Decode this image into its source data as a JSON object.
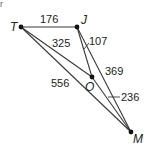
{
  "diagram": {
    "corner_mark": "r",
    "vertices": {
      "T": {
        "label": "T",
        "x": 21,
        "y": 27
      },
      "J": {
        "label": "J",
        "x": 77,
        "y": 27
      },
      "O": {
        "label": "O",
        "x": 92,
        "y": 77
      },
      "M": {
        "label": "M",
        "x": 131,
        "y": 132
      }
    },
    "edges": [
      {
        "from": "T",
        "to": "J",
        "length": "176"
      },
      {
        "from": "T",
        "to": "O",
        "length": "325"
      },
      {
        "from": "J",
        "to": "O",
        "length": "107"
      },
      {
        "from": "J",
        "to": "M",
        "length": "369"
      },
      {
        "from": "T",
        "to": "M",
        "length": "556"
      },
      {
        "from": "O",
        "to": "M",
        "length": "236"
      }
    ],
    "labels": {
      "TJ": "176",
      "TO": "325",
      "JO": "107",
      "JM": "369",
      "TM": "556",
      "OM": "236"
    },
    "colors": {
      "line": "#3a3a3a",
      "point": "#111111",
      "text": "#222222"
    }
  }
}
